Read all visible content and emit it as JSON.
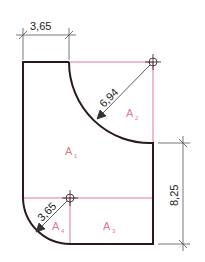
{
  "drawing": {
    "colors": {
      "outline": "#2a1a1e",
      "construction": "#e07a8f",
      "dimension": "#555555",
      "text": "#222222"
    },
    "dimensions": {
      "top_width": "3,65",
      "arc_radius_upper": "6,94",
      "arc_radius_lower": "3,65",
      "right_height": "8,25"
    },
    "areas": [
      {
        "label": "A",
        "sub": "1"
      },
      {
        "label": "A",
        "sub": "2"
      },
      {
        "label": "A",
        "sub": "3"
      },
      {
        "label": "A",
        "sub": "4"
      }
    ]
  }
}
